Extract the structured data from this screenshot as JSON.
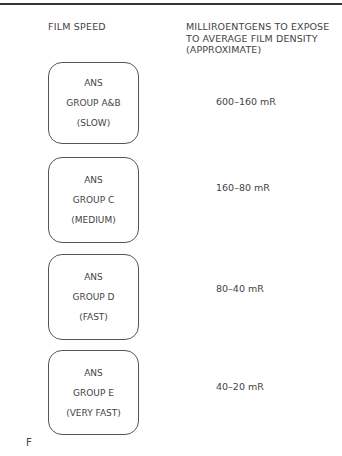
{
  "header": {
    "left": "FILM SPEED",
    "right_lines": [
      "MILLIROENTGENS TO EXPOSE",
      "TO AVERAGE FILM DENSITY",
      "(APPROXIMATE)"
    ]
  },
  "rows": [
    {
      "lines": [
        "ANS",
        "GROUP A&B",
        "(SLOW)"
      ],
      "value": "600–160 mR"
    },
    {
      "lines": [
        "ANS",
        "GROUP C",
        "(MEDIUM)"
      ],
      "value": "160–80 mR"
    },
    {
      "lines": [
        "ANS",
        "GROUP D",
        "(FAST)"
      ],
      "value": "80–40 mR"
    },
    {
      "lines": [
        "ANS",
        "GROUP E",
        "(VERY FAST)"
      ],
      "value": "40–20 mR"
    }
  ],
  "figure_label": "F"
}
